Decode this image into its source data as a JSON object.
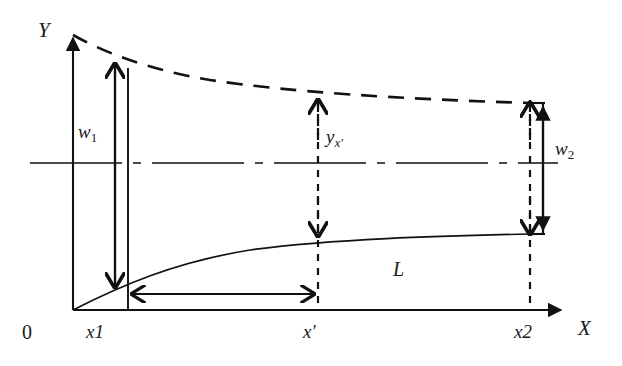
{
  "figure": {
    "background_color": "#ffffff",
    "line_color": "#111111"
  },
  "axes": {
    "y_label": "Y",
    "x_label": "X",
    "origin_label": "0",
    "y_axis": {
      "x": 73,
      "y_top": 32,
      "y_bottom": 310
    },
    "x_axis": {
      "y": 310,
      "x_left": 73,
      "x_right": 567
    }
  },
  "ticks": [
    {
      "name": "x1",
      "label": "x1",
      "x": 128
    },
    {
      "name": "x-prime",
      "label": "x′",
      "x": 318
    },
    {
      "name": "x2",
      "label": "x2",
      "x": 530
    }
  ],
  "measures": [
    {
      "name": "w1",
      "label": "w",
      "subscript": "1",
      "kind": "vertical-double-arrow",
      "x": 115,
      "y_top": 60,
      "y_bottom": 287
    },
    {
      "name": "w2",
      "label": "w",
      "subscript": "2",
      "kind": "vertical-double-arrow",
      "x": 543,
      "y_top": 103,
      "y_bottom": 234
    },
    {
      "name": "y-x-prime",
      "label": "y",
      "subscript": "x′",
      "kind": "vertical-dashed-double-arrow",
      "x": 318,
      "y_top": 96,
      "y_bottom": 236
    },
    {
      "name": "L",
      "label": "L",
      "kind": "horizontal-double-arrow",
      "x_left": 128,
      "x_right": 318,
      "y": 294
    }
  ],
  "curves": [
    {
      "name": "upper-boundary",
      "style": "dashed",
      "description": "Upper envelope decreasing from Y axis to x2",
      "points": [
        [
          73,
          35
        ],
        [
          130,
          63
        ],
        [
          200,
          78
        ],
        [
          280,
          89
        ],
        [
          360,
          95
        ],
        [
          450,
          100
        ],
        [
          530,
          103
        ]
      ]
    },
    {
      "name": "lower-boundary",
      "style": "solid",
      "description": "Lower envelope L rising from origin to x2",
      "points": [
        [
          73,
          310
        ],
        [
          110,
          291
        ],
        [
          150,
          275
        ],
        [
          200,
          262
        ],
        [
          260,
          250
        ],
        [
          318,
          243
        ],
        [
          400,
          239
        ],
        [
          470,
          236
        ],
        [
          530,
          234
        ]
      ]
    },
    {
      "name": "centerline",
      "style": "dash-dot",
      "description": "Horizontal centre axis",
      "y": 163,
      "x_left": 30,
      "x_right": 558
    }
  ]
}
